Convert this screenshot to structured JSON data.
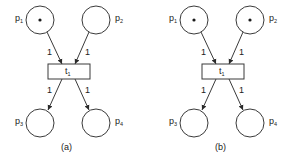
{
  "figure": {
    "diagrams": [
      {
        "caption": "(a)",
        "places": [
          {
            "id": "p1",
            "base": "p",
            "sub": "1",
            "tokens": 1
          },
          {
            "id": "p2",
            "base": "p",
            "sub": "2",
            "tokens": 0
          },
          {
            "id": "p3",
            "base": "p",
            "sub": "3",
            "tokens": 0
          },
          {
            "id": "p4",
            "base": "p",
            "sub": "4",
            "tokens": 0
          }
        ],
        "transition": {
          "id": "t1",
          "base": "t",
          "sub": "1"
        },
        "arcs": [
          {
            "from": "p1",
            "to": "t1",
            "weight": "1"
          },
          {
            "from": "p2",
            "to": "t1",
            "weight": "1"
          },
          {
            "from": "t1",
            "to": "p3",
            "weight": "1"
          },
          {
            "from": "t1",
            "to": "p4",
            "weight": "1"
          }
        ]
      },
      {
        "caption": "(b)",
        "places": [
          {
            "id": "p1",
            "base": "p",
            "sub": "1",
            "tokens": 1
          },
          {
            "id": "p2",
            "base": "p",
            "sub": "2",
            "tokens": 1
          },
          {
            "id": "p3",
            "base": "p",
            "sub": "3",
            "tokens": 0
          },
          {
            "id": "p4",
            "base": "p",
            "sub": "4",
            "tokens": 0
          }
        ],
        "transition": {
          "id": "t1",
          "base": "t",
          "sub": "1"
        },
        "arcs": [
          {
            "from": "p1",
            "to": "t1",
            "weight": "1"
          },
          {
            "from": "p2",
            "to": "t1",
            "weight": "1"
          },
          {
            "from": "t1",
            "to": "p3",
            "weight": "1"
          },
          {
            "from": "t1",
            "to": "p4",
            "weight": "1"
          }
        ]
      }
    ]
  }
}
